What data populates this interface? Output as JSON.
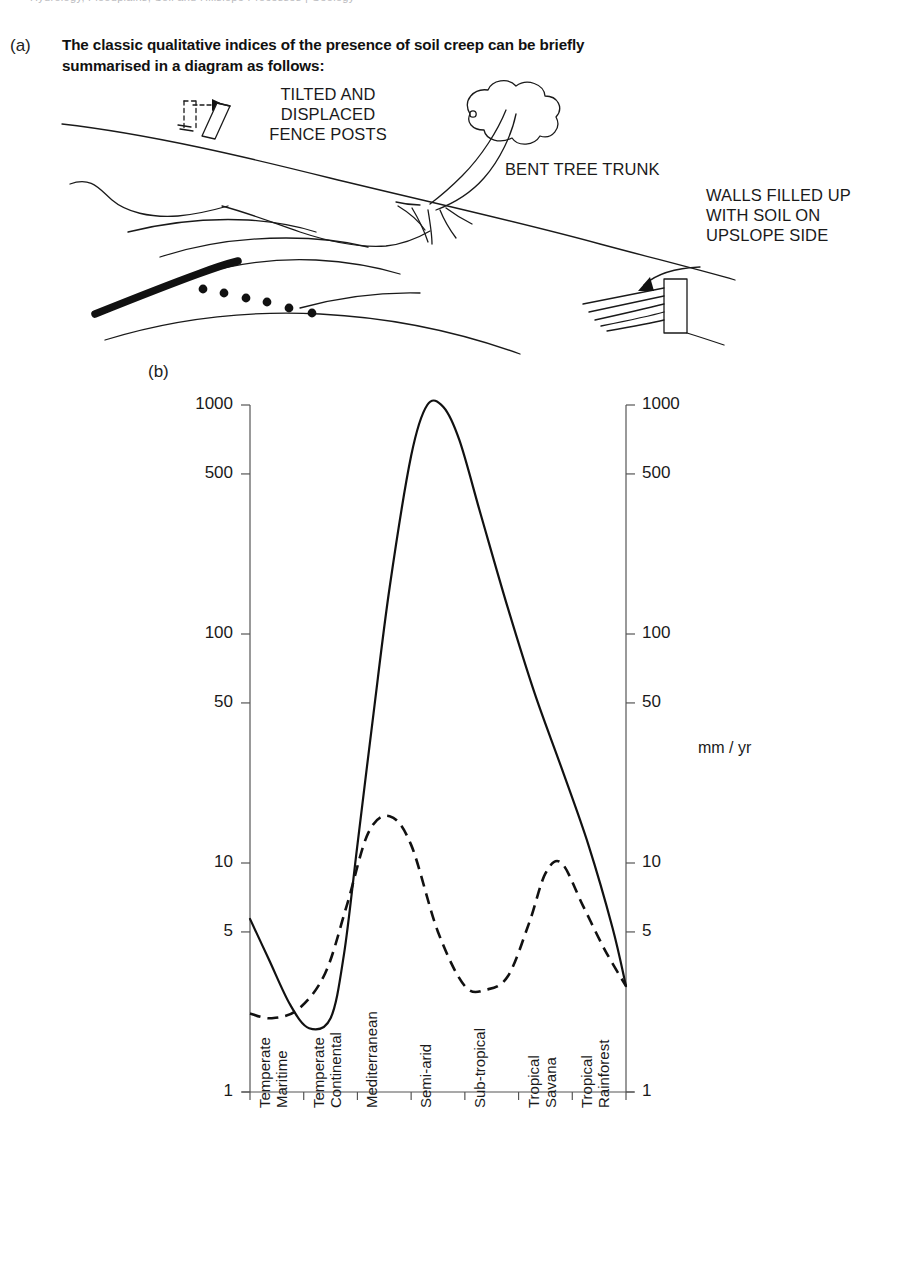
{
  "running_head": "Hydrology, Floodplains, Soil and Hillslope Processes | Geology",
  "panels": {
    "a": {
      "tag": "(a)",
      "caption": "The classic qualitative indices of the presence of soil creep can be briefly summarised in a diagram as follows:",
      "annotations": {
        "fence": "TILTED AND\nDISPLACED\nFENCE POSTS",
        "fence_line1": "TILTED AND",
        "fence_line2": "DISPLACED",
        "fence_line3": "FENCE POSTS",
        "trunk": "BENT TREE TRUNK",
        "walls_line1": "WALLS FILLED UP",
        "walls_line2": "WITH SOIL ON",
        "walls_line3": "UPSLOPE SIDE"
      }
    },
    "b": {
      "tag": "(b)",
      "unit_label": "mm / yr"
    }
  },
  "chart_data": {
    "type": "line",
    "title": "",
    "xlabel": "",
    "ylabel": "mm / yr",
    "y_scale": "log",
    "ylim": [
      1,
      1000
    ],
    "y_ticks": [
      1000,
      500,
      100,
      50,
      10,
      5,
      1
    ],
    "y_tick_labels": [
      "1000",
      "500",
      "100",
      "50",
      "10",
      "5",
      "1"
    ],
    "right_axis": true,
    "right_y_ticks": [
      1000,
      500,
      100,
      50,
      10,
      5,
      1
    ],
    "right_y_tick_labels": [
      "1000",
      "500",
      "100",
      "50",
      "10",
      "5",
      "1"
    ],
    "grid": false,
    "legend": null,
    "categories": [
      "Temperate Maritime",
      "Temperate Continental",
      "Mediterranean",
      "Semi-arid",
      "Sub-tropical",
      "Tropical Savana",
      "Tropical Rainforest"
    ],
    "category_lines": [
      [
        "Temperate",
        "Maritime"
      ],
      [
        "Temperate",
        "Continental"
      ],
      [
        "Mediterranean"
      ],
      [
        "Semi-arid"
      ],
      [
        "Sub-tropical"
      ],
      [
        "Tropical",
        "Savana"
      ],
      [
        "Tropical",
        "Rainforest"
      ]
    ],
    "series": [
      {
        "name": "solid curve",
        "style": "solid",
        "x": [
          0.0,
          0.35,
          0.75,
          1.1,
          1.5,
          1.75,
          2.0,
          2.3,
          2.6,
          3.0,
          3.3,
          3.6,
          3.9,
          4.3,
          4.8,
          5.3,
          5.8,
          6.3,
          6.75,
          7.0
        ],
        "values": [
          5.7,
          3.8,
          2.4,
          1.9,
          2.1,
          4.0,
          12.0,
          45.0,
          160.0,
          600.0,
          1000.0,
          980.0,
          700.0,
          330.0,
          130.0,
          55.0,
          26.0,
          12.0,
          5.2,
          2.9
        ]
      },
      {
        "name": "dashed curve",
        "style": "dashed",
        "x": [
          0.0,
          0.4,
          0.9,
          1.4,
          1.8,
          2.2,
          2.6,
          3.0,
          3.5,
          4.0,
          4.4,
          4.8,
          5.2,
          5.5,
          5.8,
          6.2,
          6.6,
          7.0
        ],
        "values": [
          2.2,
          2.1,
          2.3,
          3.3,
          6.5,
          13.5,
          16.0,
          12.0,
          5.0,
          2.9,
          2.8,
          3.2,
          5.5,
          9.0,
          10.0,
          6.5,
          4.2,
          2.9
        ]
      }
    ]
  }
}
